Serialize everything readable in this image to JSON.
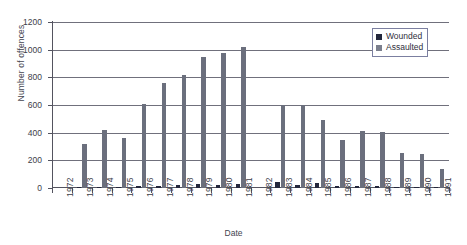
{
  "chart_data": {
    "type": "bar",
    "title": "",
    "xlabel": "Date",
    "ylabel": "Number of offences",
    "ylim": [
      0,
      1200
    ],
    "yticks": [
      0,
      200,
      400,
      600,
      800,
      1000,
      1200
    ],
    "grid": true,
    "legend_position": "top-right",
    "categories": [
      "1972",
      "1973",
      "1974",
      "1975",
      "1976",
      "1977",
      "1978",
      "1979",
      "1980",
      "1981",
      "1982",
      "1983",
      "1984",
      "1985",
      "1986",
      "1987",
      "1988",
      "1989",
      "1990",
      "1991"
    ],
    "series": [
      {
        "name": "Wounded",
        "color": "#23273c",
        "values": [
          0,
          8,
          10,
          10,
          12,
          14,
          22,
          30,
          25,
          26,
          0,
          45,
          22,
          38,
          16,
          14,
          14,
          10,
          10,
          8
        ]
      },
      {
        "name": "Assaulted",
        "color": "#6b6f7d",
        "values": [
          0,
          315,
          420,
          360,
          610,
          760,
          820,
          945,
          975,
          1020,
          0,
          600,
          600,
          490,
          345,
          410,
          405,
          250,
          245,
          135
        ]
      }
    ]
  },
  "legend": {
    "items": [
      {
        "label": "Wounded"
      },
      {
        "label": "Assaulted"
      }
    ]
  },
  "axes": {
    "y_title": "Number of offences",
    "x_title": "Date"
  }
}
